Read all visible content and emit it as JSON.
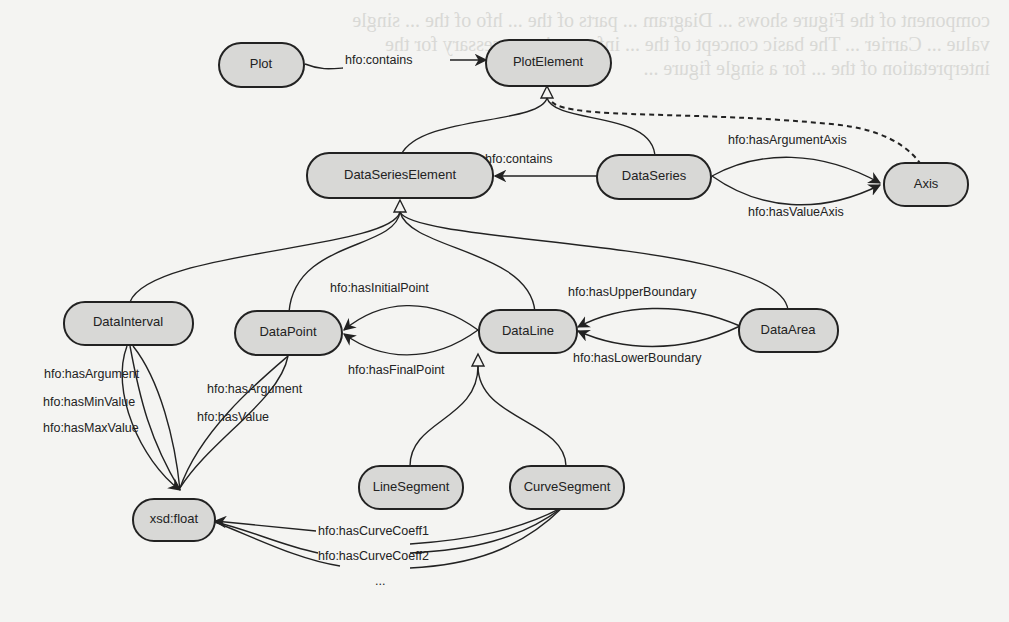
{
  "diagram": {
    "title": "",
    "nodes": {
      "plot": "Plot",
      "plot_element": "PlotElement",
      "data_series_element": "DataSeriesElement",
      "data_series": "DataSeries",
      "axis": "Axis",
      "data_interval": "DataInterval",
      "data_point": "DataPoint",
      "data_line": "DataLine",
      "data_area": "DataArea",
      "line_segment": "LineSegment",
      "curve_segment": "CurveSegment",
      "xsd_float": "xsd:float"
    },
    "edge_labels": {
      "plot_contains": "hfo:contains",
      "series_contains": "hfo:contains",
      "has_argument_axis": "hfo:hasArgumentAxis",
      "has_value_axis": "hfo:hasValueAxis",
      "has_initial_point": "hfo:hasInitialPoint",
      "has_final_point": "hfo:hasFinalPoint",
      "has_upper_boundary": "hfo:hasUpperBoundary",
      "has_lower_boundary": "hfo:hasLowerBoundary",
      "interval_has_argument": "hfo:hasArgument",
      "interval_has_min_value": "hfo:hasMinValue",
      "interval_has_max_value": "hfo:hasMaxValue",
      "point_has_argument": "hfo:hasArgument",
      "point_has_value": "hfo:hasValue",
      "has_curve_coeff1": "hfo:hasCurveCoeff1",
      "has_curve_coeff2": "hfo:hasCurveCoeff2",
      "ellipsis": "..."
    },
    "edges": [
      {
        "from": "Plot",
        "to": "PlotElement",
        "label": "hfo:contains",
        "type": "property"
      },
      {
        "from": "DataSeriesElement",
        "to": "PlotElement",
        "type": "subclass"
      },
      {
        "from": "DataSeries",
        "to": "PlotElement",
        "type": "subclass"
      },
      {
        "from": "Axis",
        "to": "PlotElement",
        "type": "subclass-dashed"
      },
      {
        "from": "DataSeries",
        "to": "DataSeriesElement",
        "label": "hfo:contains",
        "type": "property"
      },
      {
        "from": "DataSeries",
        "to": "Axis",
        "label": "hfo:hasArgumentAxis",
        "type": "property"
      },
      {
        "from": "DataSeries",
        "to": "Axis",
        "label": "hfo:hasValueAxis",
        "type": "property"
      },
      {
        "from": "DataInterval",
        "to": "DataSeriesElement",
        "type": "subclass"
      },
      {
        "from": "DataPoint",
        "to": "DataSeriesElement",
        "type": "subclass"
      },
      {
        "from": "DataLine",
        "to": "DataSeriesElement",
        "type": "subclass"
      },
      {
        "from": "DataArea",
        "to": "DataSeriesElement",
        "type": "subclass"
      },
      {
        "from": "DataLine",
        "to": "DataPoint",
        "label": "hfo:hasInitialPoint",
        "type": "property"
      },
      {
        "from": "DataLine",
        "to": "DataPoint",
        "label": "hfo:hasFinalPoint",
        "type": "property"
      },
      {
        "from": "DataArea",
        "to": "DataLine",
        "label": "hfo:hasUpperBoundary",
        "type": "property"
      },
      {
        "from": "DataArea",
        "to": "DataLine",
        "label": "hfo:hasLowerBoundary",
        "type": "property"
      },
      {
        "from": "LineSegment",
        "to": "DataLine",
        "type": "subclass"
      },
      {
        "from": "CurveSegment",
        "to": "DataLine",
        "type": "subclass"
      },
      {
        "from": "DataInterval",
        "to": "xsd:float",
        "label": "hfo:hasArgument",
        "type": "property"
      },
      {
        "from": "DataInterval",
        "to": "xsd:float",
        "label": "hfo:hasMinValue",
        "type": "property"
      },
      {
        "from": "DataInterval",
        "to": "xsd:float",
        "label": "hfo:hasMaxValue",
        "type": "property"
      },
      {
        "from": "DataPoint",
        "to": "xsd:float",
        "label": "hfo:hasArgument",
        "type": "property"
      },
      {
        "from": "DataPoint",
        "to": "xsd:float",
        "label": "hfo:hasValue",
        "type": "property"
      },
      {
        "from": "CurveSegment",
        "to": "xsd:float",
        "label": "hfo:hasCurveCoeff1",
        "type": "property"
      },
      {
        "from": "CurveSegment",
        "to": "xsd:float",
        "label": "hfo:hasCurveCoeff2",
        "type": "property"
      },
      {
        "from": "CurveSegment",
        "to": "xsd:float",
        "label": "...",
        "type": "property"
      }
    ]
  },
  "bleed_through_text": "component of the Figure shows ... Diagram ... parts of the ... hfo of the ... single value ... Carrier ... The basic concept of the ... information necessary for the interpretation of the ... for a single figure ..."
}
